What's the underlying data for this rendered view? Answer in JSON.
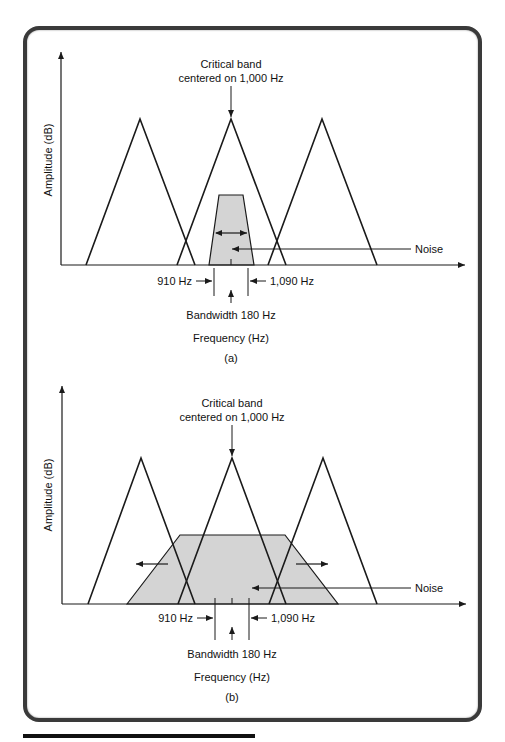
{
  "figure": {
    "panels": [
      {
        "id": "a",
        "caption": "(a)",
        "y_axis_label": "Amplitude (dB)",
        "x_axis_label": "Frequency (Hz)",
        "critical_band_label_line1": "Critical band",
        "critical_band_label_line2": "centered on 1,000 Hz",
        "noise_label": "Noise",
        "low_edge_label": "910 Hz",
        "high_edge_label": "1,090 Hz",
        "bandwidth_label": "Bandwidth 180 Hz",
        "noise_width": "narrow (within critical band)"
      },
      {
        "id": "b",
        "caption": "(b)",
        "y_axis_label": "Amplitude (dB)",
        "x_axis_label": "Frequency (Hz)",
        "critical_band_label_line1": "Critical band",
        "critical_band_label_line2": "centered on 1,000 Hz",
        "noise_label": "Noise",
        "low_edge_label": "910 Hz",
        "high_edge_label": "1,090 Hz",
        "bandwidth_label": "Bandwidth 180 Hz",
        "noise_width": "wide (extends beyond critical band)"
      }
    ],
    "colors": {
      "line": "#1a1a1a",
      "noise_fill": "#d4d4d4",
      "frame": "#3a3a3a"
    }
  }
}
